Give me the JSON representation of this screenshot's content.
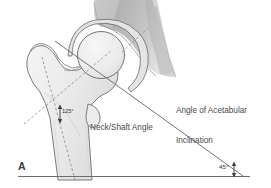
{
  "figure": {
    "panel_label": "A",
    "kind": "hip-joint-anatomy-diagram",
    "background_color": "#ffffff",
    "outline_color": "#6e6e6e",
    "bone_fill_color": "#eeeeee",
    "pelvis_fill_color": "#b9b9b9",
    "text_color": "#4a4a4a"
  },
  "annotations": {
    "acetabular_inclination_label": "Angle of Acetabular\nInclination",
    "acetabular_inclination_line1": "Angle of Acetabular",
    "acetabular_inclination_line2": "Inclination",
    "neck_shaft_label": "Neck/Shaft Angle",
    "neck_shaft_value": "125°",
    "acetabular_inclination_value": "45°"
  },
  "structures": {
    "pelvis": "pelvis",
    "acetabulum": "acetabulum",
    "femoral_head": "femoral-head",
    "femoral_neck": "femoral-neck",
    "greater_trochanter": "greater-trochanter",
    "lesser_trochanter": "lesser-trochanter",
    "femoral_shaft": "femoral-shaft"
  },
  "reference_lines": {
    "horizontal_baseline": "horizontal-reference-line",
    "acetabular_roof_line": "acetabular-roof-line",
    "shaft_axis": "femoral-shaft-axis-dashed",
    "neck_axis": "femoral-neck-axis-dashed",
    "acetabular_rim_dashed": "acetabular-rim-dashed"
  }
}
